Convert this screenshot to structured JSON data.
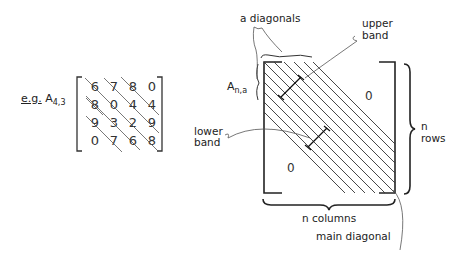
{
  "example": {
    "prefix": "e.g.",
    "symbol": "A",
    "subscript": "4,3",
    "matrix": [
      [
        "6",
        "7",
        "8",
        "0"
      ],
      [
        "8",
        "0",
        "4",
        "4"
      ],
      [
        "9",
        "3",
        "2",
        "9"
      ],
      [
        "0",
        "7",
        "6",
        "8"
      ]
    ]
  },
  "band_matrix": {
    "symbol": "A",
    "subscript": "n,a",
    "upper_zero": "0",
    "lower_zero": "0"
  },
  "labels": {
    "a_diagonals": "a diagonals",
    "upper_band_1": "upper",
    "upper_band_2": "band",
    "lower_band_1": "lower",
    "lower_band_2": "band",
    "n_rows_1": "n",
    "n_rows_2": "rows",
    "n_columns": "n  columns",
    "main_diagonal": "main diagonal"
  },
  "colors": {
    "ink": "#222222",
    "background": "#ffffff"
  }
}
